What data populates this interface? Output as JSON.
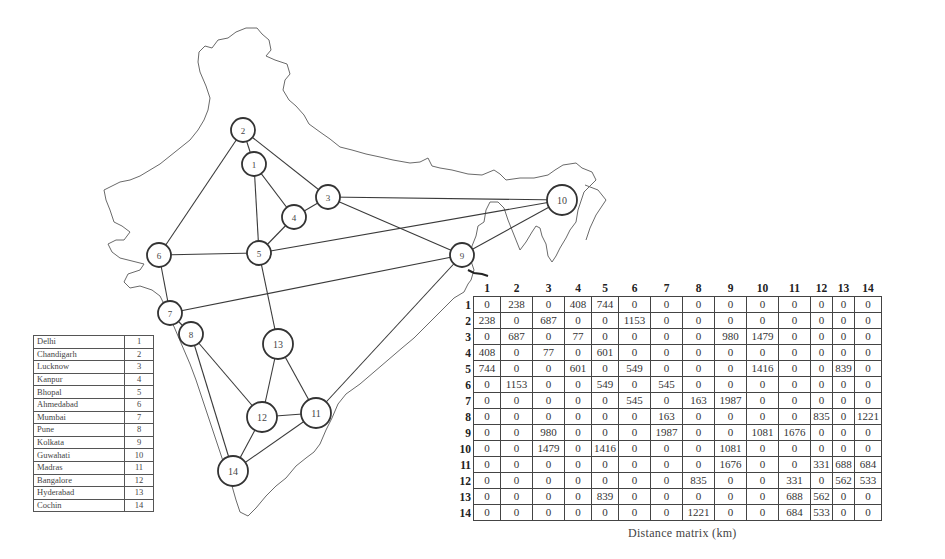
{
  "figure": {
    "caption": "Distance matrix (km)"
  },
  "legend": {
    "rows": [
      {
        "city": "Delhi",
        "id": "1"
      },
      {
        "city": "Chandigarh",
        "id": "2"
      },
      {
        "city": "Lucknow",
        "id": "3"
      },
      {
        "city": "Kanpur",
        "id": "4"
      },
      {
        "city": "Bhopal",
        "id": "5"
      },
      {
        "city": "Ahmedabad",
        "id": "6"
      },
      {
        "city": "Mumbai",
        "id": "7"
      },
      {
        "city": "Pune",
        "id": "8"
      },
      {
        "city": "Kolkata",
        "id": "9"
      },
      {
        "city": "Guwahati",
        "id": "10"
      },
      {
        "city": "Madras",
        "id": "11"
      },
      {
        "city": "Bangalore",
        "id": "12"
      },
      {
        "city": "Hyderabad",
        "id": "13"
      },
      {
        "city": "Cochin",
        "id": "14"
      }
    ]
  },
  "nodes": [
    {
      "id": "1",
      "x": 254,
      "y": 164,
      "r": 12
    },
    {
      "id": "2",
      "x": 243,
      "y": 130,
      "r": 12
    },
    {
      "id": "3",
      "x": 328,
      "y": 197,
      "r": 12
    },
    {
      "id": "4",
      "x": 294,
      "y": 217,
      "r": 12
    },
    {
      "id": "5",
      "x": 259,
      "y": 253,
      "r": 12
    },
    {
      "id": "6",
      "x": 159,
      "y": 255,
      "r": 12
    },
    {
      "id": "7",
      "x": 170,
      "y": 313,
      "r": 12
    },
    {
      "id": "8",
      "x": 191,
      "y": 334,
      "r": 12
    },
    {
      "id": "9",
      "x": 462,
      "y": 255,
      "r": 12
    },
    {
      "id": "10",
      "x": 562,
      "y": 200,
      "r": 15
    },
    {
      "id": "11",
      "x": 316,
      "y": 413,
      "r": 15
    },
    {
      "id": "12",
      "x": 262,
      "y": 417,
      "r": 15
    },
    {
      "id": "13",
      "x": 278,
      "y": 344,
      "r": 15
    },
    {
      "id": "14",
      "x": 233,
      "y": 471,
      "r": 15
    }
  ],
  "edges": [
    [
      "1",
      "2"
    ],
    [
      "1",
      "4"
    ],
    [
      "1",
      "5"
    ],
    [
      "2",
      "3"
    ],
    [
      "2",
      "6"
    ],
    [
      "3",
      "4"
    ],
    [
      "3",
      "9"
    ],
    [
      "3",
      "10"
    ],
    [
      "4",
      "5"
    ],
    [
      "5",
      "6"
    ],
    [
      "5",
      "10"
    ],
    [
      "5",
      "13"
    ],
    [
      "6",
      "7"
    ],
    [
      "7",
      "8"
    ],
    [
      "7",
      "9"
    ],
    [
      "8",
      "12"
    ],
    [
      "8",
      "14"
    ],
    [
      "9",
      "10"
    ],
    [
      "9",
      "11"
    ],
    [
      "11",
      "12"
    ],
    [
      "11",
      "13"
    ],
    [
      "11",
      "14"
    ],
    [
      "12",
      "13"
    ],
    [
      "12",
      "14"
    ]
  ],
  "matrix": {
    "headers": [
      "1",
      "2",
      "3",
      "4",
      "5",
      "6",
      "7",
      "8",
      "9",
      "10",
      "11",
      "12",
      "13",
      "14"
    ],
    "rows": [
      {
        "label": "1",
        "cells": [
          "0",
          "238",
          "0",
          "408",
          "744",
          "0",
          "0",
          "0",
          "0",
          "0",
          "0",
          "0",
          "0",
          "0"
        ]
      },
      {
        "label": "2",
        "cells": [
          "238",
          "0",
          "687",
          "0",
          "0",
          "1153",
          "0",
          "0",
          "0",
          "0",
          "0",
          "0",
          "0",
          "0"
        ]
      },
      {
        "label": "3",
        "cells": [
          "0",
          "687",
          "0",
          "77",
          "0",
          "0",
          "0",
          "0",
          "980",
          "1479",
          "0",
          "0",
          "0",
          "0"
        ]
      },
      {
        "label": "4",
        "cells": [
          "408",
          "0",
          "77",
          "0",
          "601",
          "0",
          "0",
          "0",
          "0",
          "0",
          "0",
          "0",
          "0",
          "0"
        ]
      },
      {
        "label": "5",
        "cells": [
          "744",
          "0",
          "0",
          "601",
          "0",
          "549",
          "0",
          "0",
          "0",
          "1416",
          "0",
          "0",
          "839",
          "0"
        ]
      },
      {
        "label": "6",
        "cells": [
          "0",
          "1153",
          "0",
          "0",
          "549",
          "0",
          "545",
          "0",
          "0",
          "0",
          "0",
          "0",
          "0",
          "0"
        ]
      },
      {
        "label": "7",
        "cells": [
          "0",
          "0",
          "0",
          "0",
          "0",
          "545",
          "0",
          "163",
          "1987",
          "0",
          "0",
          "0",
          "0",
          "0"
        ]
      },
      {
        "label": "8",
        "cells": [
          "0",
          "0",
          "0",
          "0",
          "0",
          "0",
          "163",
          "0",
          "0",
          "0",
          "0",
          "835",
          "0",
          "1221"
        ]
      },
      {
        "label": "9",
        "cells": [
          "0",
          "0",
          "980",
          "0",
          "0",
          "0",
          "1987",
          "0",
          "0",
          "1081",
          "1676",
          "0",
          "0",
          "0"
        ]
      },
      {
        "label": "10",
        "cells": [
          "0",
          "0",
          "1479",
          "0",
          "1416",
          "0",
          "0",
          "0",
          "1081",
          "0",
          "0",
          "0",
          "0",
          "0"
        ]
      },
      {
        "label": "11",
        "cells": [
          "0",
          "0",
          "0",
          "0",
          "0",
          "0",
          "0",
          "0",
          "1676",
          "0",
          "0",
          "331",
          "688",
          "684"
        ]
      },
      {
        "label": "12",
        "cells": [
          "0",
          "0",
          "0",
          "0",
          "0",
          "0",
          "0",
          "835",
          "0",
          "0",
          "331",
          "0",
          "562",
          "533"
        ]
      },
      {
        "label": "13",
        "cells": [
          "0",
          "0",
          "0",
          "0",
          "839",
          "0",
          "0",
          "0",
          "0",
          "0",
          "688",
          "562",
          "0",
          "0"
        ]
      },
      {
        "label": "14",
        "cells": [
          "0",
          "0",
          "0",
          "0",
          "0",
          "0",
          "0",
          "1221",
          "0",
          "0",
          "684",
          "533",
          "0",
          "0"
        ]
      }
    ]
  },
  "colors": {
    "outline": "#6a6a6a",
    "edge": "#3a3a3a",
    "node_stroke": "#333333",
    "grid": "#444444"
  }
}
